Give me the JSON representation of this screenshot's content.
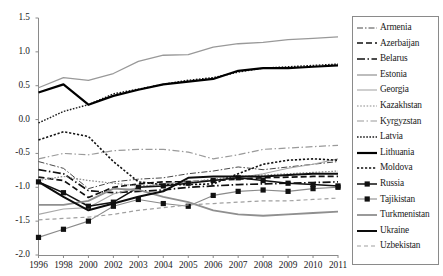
{
  "chart_data": {
    "type": "line",
    "title": "",
    "subtitle": "",
    "xlabel": "",
    "ylabel": "",
    "x": [
      "1996",
      "1998",
      "2000",
      "2002",
      "2003",
      "2004",
      "2005",
      "2006",
      "2007",
      "2008",
      "2009",
      "2010",
      "2011"
    ],
    "categories": [
      "1996",
      "1998",
      "2000",
      "2002",
      "2003",
      "2004",
      "2005",
      "2006",
      "2007",
      "2008",
      "2009",
      "2010",
      "2011"
    ],
    "ylim": [
      -2.0,
      1.5
    ],
    "yticks": [
      "1.5",
      "1.0",
      "0.5",
      "0.0",
      "-0.5",
      "-1.0",
      "-1.5",
      "-2.0"
    ],
    "ytick_values": [
      1.5,
      1.0,
      0.5,
      0.0,
      -0.5,
      -1.0,
      -1.5,
      -2.0
    ],
    "grid": false,
    "legend_position": "right",
    "series": [
      {
        "name": "Armenia",
        "style": "dash-dot-thin",
        "color": "#333333",
        "width": 0.9,
        "values": [
          -0.62,
          -0.72,
          -1.02,
          -0.92,
          -0.88,
          -0.86,
          -0.8,
          -0.76,
          -0.7,
          -0.74,
          -0.7,
          -0.66,
          -0.62
        ]
      },
      {
        "name": "Azerbaijan",
        "style": "dashed-bold",
        "color": "#111111",
        "width": 1.7,
        "values": [
          -0.85,
          -0.9,
          -1.15,
          -1.0,
          -0.95,
          -0.92,
          -0.92,
          -0.9,
          -0.88,
          -0.86,
          -0.85,
          -0.84,
          -0.84
        ]
      },
      {
        "name": "Belarus",
        "style": "dash-dot-bold",
        "color": "#111111",
        "width": 1.7,
        "values": [
          -0.74,
          -0.8,
          -1.05,
          -1.08,
          -1.06,
          -1.04,
          -1.0,
          -0.98,
          -0.96,
          -0.95,
          -0.94,
          -0.93,
          -0.92
        ]
      },
      {
        "name": "Estonia",
        "style": "solid-gray",
        "color": "#999999",
        "width": 1.3,
        "values": [
          0.47,
          0.62,
          0.58,
          0.68,
          0.86,
          0.95,
          0.96,
          1.07,
          1.12,
          1.14,
          1.18,
          1.2,
          1.22
        ]
      },
      {
        "name": "Georgia",
        "style": "solid-gray-thin",
        "color": "#a8a8a8",
        "width": 1.1,
        "values": [
          -1.4,
          -1.32,
          -1.3,
          -1.1,
          -1.0,
          -0.95,
          -0.92,
          -0.9,
          -0.86,
          -0.8,
          -0.72,
          -0.66,
          -0.58
        ]
      },
      {
        "name": "Kazakhstan",
        "style": "dotted-gray",
        "color": "#8c8c8c",
        "width": 1.2,
        "values": [
          -0.9,
          -0.84,
          -0.9,
          -0.94,
          -0.98,
          -0.96,
          -0.92,
          -0.88,
          -0.84,
          -0.82,
          -0.8,
          -0.78,
          -0.76
        ]
      },
      {
        "name": "Kyrgyzstan",
        "style": "dash-dot-gray",
        "color": "#9a9a9a",
        "width": 1.2,
        "values": [
          -0.58,
          -0.5,
          -0.52,
          -0.46,
          -0.44,
          -0.44,
          -0.48,
          -0.58,
          -0.52,
          -0.44,
          -0.42,
          -0.4,
          -0.38
        ]
      },
      {
        "name": "Latvia",
        "style": "dotted-dark",
        "color": "#1a1a1a",
        "width": 1.4,
        "values": [
          -0.05,
          0.12,
          0.22,
          0.38,
          0.45,
          0.52,
          0.58,
          0.62,
          0.7,
          0.76,
          0.78,
          0.8,
          0.82
        ]
      },
      {
        "name": "Lithuania",
        "style": "solid-bold",
        "color": "#000000",
        "width": 2.2,
        "values": [
          0.4,
          0.52,
          0.22,
          0.35,
          0.44,
          0.52,
          0.56,
          0.6,
          0.72,
          0.76,
          0.76,
          0.78,
          0.8
        ]
      },
      {
        "name": "Moldova",
        "style": "dotted-bold",
        "color": "#111111",
        "width": 1.6,
        "values": [
          -0.3,
          -0.18,
          -0.25,
          -0.62,
          -0.92,
          -0.96,
          -0.96,
          -0.95,
          -0.8,
          -0.66,
          -0.6,
          -0.58,
          -0.6
        ]
      },
      {
        "name": "Russia",
        "style": "solid-marker-sq",
        "color": "#111111",
        "width": 1.5,
        "values": [
          -0.92,
          -1.08,
          -1.28,
          -1.22,
          -1.0,
          -0.98,
          -0.94,
          -0.9,
          -0.86,
          -0.9,
          -0.94,
          -0.96,
          -0.98
        ]
      },
      {
        "name": "Tajikistan",
        "style": "gray-marker-sq",
        "color": "#8a8a8a",
        "width": 1.1,
        "values": [
          -1.74,
          -1.62,
          -1.5,
          -1.28,
          -1.18,
          -1.24,
          -1.28,
          -1.12,
          -1.06,
          -1.04,
          -1.06,
          -1.02,
          -1.0
        ]
      },
      {
        "name": "Turkmenistan",
        "style": "solid-gray-thick",
        "color": "#8f8f8f",
        "width": 1.8,
        "values": [
          -1.26,
          -1.26,
          -1.2,
          -1.02,
          -1.04,
          -1.14,
          -1.22,
          -1.34,
          -1.4,
          -1.42,
          -1.4,
          -1.38,
          -1.36
        ]
      },
      {
        "name": "Ukraine",
        "style": "solid-bold-2",
        "color": "#0d0d0d",
        "width": 2.0,
        "values": [
          -0.92,
          -1.14,
          -1.34,
          -1.24,
          -1.14,
          -1.06,
          -0.86,
          -0.84,
          -0.84,
          -0.84,
          -0.82,
          -0.8,
          -0.8
        ]
      },
      {
        "name": "Uzbekistan",
        "style": "dashed-gray",
        "color": "#a0a0a0",
        "width": 1.2,
        "values": [
          -1.48,
          -1.46,
          -1.44,
          -1.4,
          -1.34,
          -1.3,
          -1.26,
          -1.24,
          -1.22,
          -1.2,
          -1.2,
          -1.18,
          -1.16
        ]
      }
    ]
  },
  "legend": {
    "items": [
      {
        "label": "Armenia"
      },
      {
        "label": "Azerbaijan"
      },
      {
        "label": "Belarus"
      },
      {
        "label": "Estonia"
      },
      {
        "label": "Georgia"
      },
      {
        "label": "Kazakhstan"
      },
      {
        "label": "Kyrgyzstan"
      },
      {
        "label": "Latvia"
      },
      {
        "label": "Lithuania"
      },
      {
        "label": "Moldova"
      },
      {
        "label": "Russia"
      },
      {
        "label": "Tajikistan"
      },
      {
        "label": "Turkmenistan"
      },
      {
        "label": "Ukraine"
      },
      {
        "label": "Uzbekistan"
      }
    ]
  },
  "colors": {
    "axis": "#8a8a8a",
    "text": "#1a1a1a",
    "background": "#ffffff"
  }
}
